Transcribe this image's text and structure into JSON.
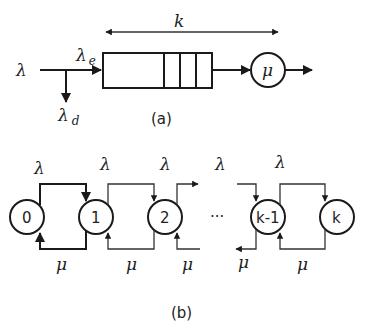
{
  "diagram_a": {
    "caption": "(a)",
    "arrival_label": "λ",
    "effective_label": "λ",
    "effective_sub": "e",
    "dropped_label": "λ",
    "dropped_sub": "d",
    "capacity_label": "k",
    "server_label": "μ"
  },
  "diagram_b": {
    "caption": "(b)",
    "ellipsis": "···",
    "states": [
      "0",
      "1",
      "2",
      "k-1",
      "k"
    ],
    "arrival_labels": [
      "λ",
      "λ",
      "λ",
      "λ",
      "λ"
    ],
    "service_labels": [
      "μ",
      "μ",
      "μ",
      "μ",
      "μ"
    ]
  },
  "colors": {
    "line": "#1a1a1a",
    "background": "#ffffff"
  }
}
